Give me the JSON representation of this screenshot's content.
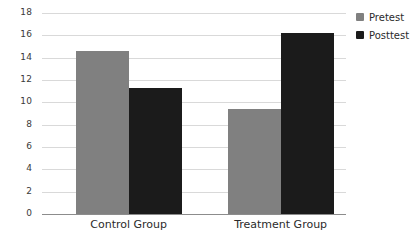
{
  "chart_data": {
    "type": "bar",
    "title": "",
    "subtitle": "",
    "xlabel": "",
    "ylabel": "",
    "categories": [
      "Control Group",
      "Treatment Group"
    ],
    "series": [
      {
        "name": "Pretest",
        "color": "#808080",
        "values": [
          14.6,
          9.4
        ]
      },
      {
        "name": "Posttest",
        "color": "#1b1b1b",
        "values": [
          11.3,
          16.2
        ]
      }
    ],
    "ylim": [
      0,
      18
    ],
    "ytick_step": 2,
    "yticks": [
      18,
      16,
      14,
      12,
      10,
      8,
      6,
      4,
      2,
      0
    ],
    "ytick_labels": [
      "18",
      "16",
      "14",
      "12",
      "10",
      "8",
      "6",
      "4",
      "2",
      "0"
    ],
    "grid": true,
    "grid_axis": "y",
    "grid_color": "#d9d9d9",
    "axis_color": "#8c8c8c",
    "legend_position": "right-top",
    "background": "#ffffff"
  },
  "legend": {
    "items": [
      {
        "label": "Pretest",
        "color": "#808080"
      },
      {
        "label": "Posttest",
        "color": "#1b1b1b"
      }
    ]
  }
}
